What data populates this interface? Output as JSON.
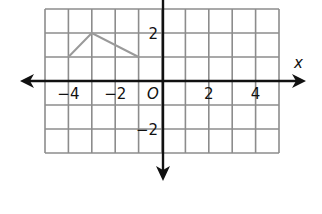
{
  "chart_data": {
    "type": "line",
    "title": "",
    "xlabel": "x",
    "ylabel": "",
    "origin_label": "O",
    "xlim": [
      -5,
      5
    ],
    "ylim": [
      -3,
      3
    ],
    "grid": true,
    "x_ticks": [
      {
        "value": -4,
        "label": "−4"
      },
      {
        "value": -2,
        "label": "−2"
      },
      {
        "value": 2,
        "label": "2"
      },
      {
        "value": 4,
        "label": "4"
      }
    ],
    "y_ticks": [
      {
        "value": 2,
        "label": "2"
      },
      {
        "value": -2,
        "label": "−2"
      }
    ],
    "series": [
      {
        "name": "polyline",
        "color": "#9a9a9a",
        "points": [
          [
            -4,
            1
          ],
          [
            -3,
            2
          ],
          [
            -1,
            1
          ]
        ]
      }
    ]
  },
  "colors": {
    "grid": "#8c8c8c",
    "axis": "#111111",
    "series": "#9a9a9a"
  }
}
